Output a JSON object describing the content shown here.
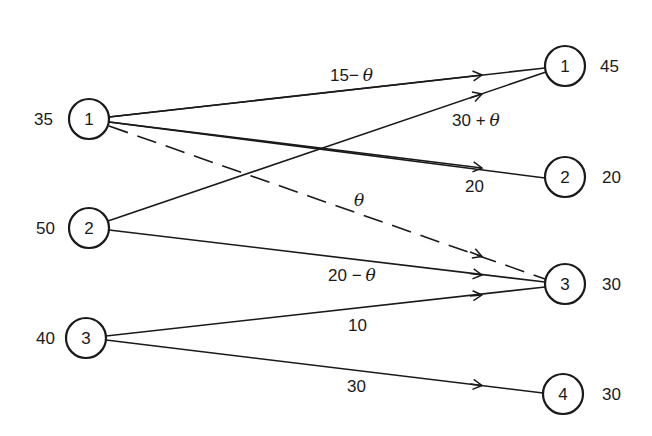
{
  "diagram": {
    "type": "transportation-network",
    "sources": [
      {
        "id": "1",
        "supply": "35",
        "cx": 89,
        "cy": 119
      },
      {
        "id": "2",
        "supply": "50",
        "cx": 89,
        "cy": 228
      },
      {
        "id": "3",
        "supply": "40",
        "cx": 86,
        "cy": 338
      }
    ],
    "sinks": [
      {
        "id": "1",
        "demand": "45",
        "cx": 565,
        "cy": 66
      },
      {
        "id": "2",
        "demand": "20",
        "cx": 565,
        "cy": 177
      },
      {
        "id": "3",
        "demand": "30",
        "cx": 565,
        "cy": 284
      },
      {
        "id": "4",
        "demand": "30",
        "cx": 563,
        "cy": 394
      }
    ],
    "edges": [
      {
        "from": "S1",
        "to": "D1",
        "label": "15 − θ",
        "style": "solid"
      },
      {
        "from": "S1",
        "to": "D2",
        "label": "20",
        "style": "solid"
      },
      {
        "from": "S1",
        "to": "D3",
        "label": "θ",
        "style": "dashed"
      },
      {
        "from": "S2",
        "to": "D1",
        "label": "30 + θ",
        "style": "solid"
      },
      {
        "from": "S2",
        "to": "D3",
        "label": "20 − θ",
        "style": "solid"
      },
      {
        "from": "S3",
        "to": "D3",
        "label": "10",
        "style": "solid"
      },
      {
        "from": "S3",
        "to": "D4",
        "label": "30",
        "style": "solid"
      }
    ]
  },
  "labels": {
    "e11": "15−",
    "e11_theta": "θ",
    "e21": "30 +",
    "e21_theta": "θ",
    "e12": "20",
    "e13_theta": "θ",
    "e23": "20 −",
    "e23_theta": "θ",
    "e33": "10",
    "e34": "30"
  }
}
